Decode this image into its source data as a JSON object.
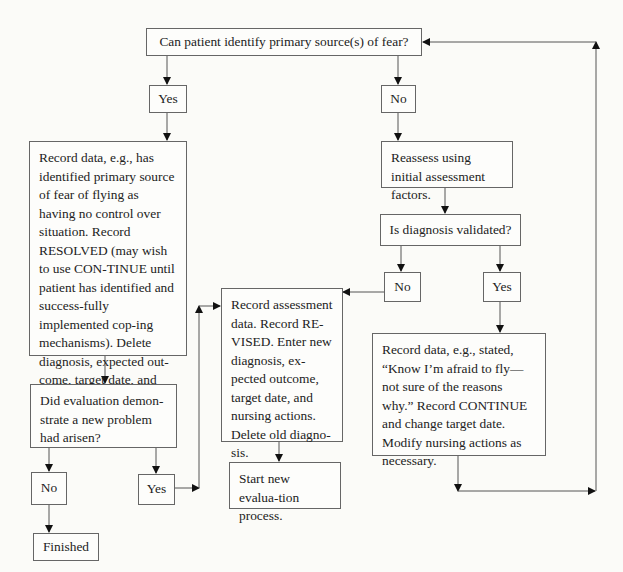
{
  "diagram": {
    "type": "flowchart",
    "nodes": {
      "q1": "Can patient identify primary source(s) of fear?",
      "q1_yes": "Yes",
      "q1_no": "No",
      "resolved": "Record data, e.g., has identified primary source of fear of flying as having no control over situation. Record RESOLVED (may wish to use CON-TINUE until patient has identified and success-fully implemented cop-ing mechanisms). Delete diagnosis, expected out-come, target date, and nursing actions.",
      "q3": "Did evaluation demon-strate a new problem had arisen?",
      "q3_no": "No",
      "q3_yes": "Yes",
      "finished": "Finished",
      "reassess": "Reassess using initial assessment factors.",
      "q2": "Is diagnosis validated?",
      "q2_no": "No",
      "q2_yes": "Yes",
      "revised": "Record assessment data. Record RE-VISED. Enter new diagnosis, ex-pected outcome, target date, and nursing actions. Delete old diagno-sis.",
      "start_new": "Start new evalua-tion process.",
      "continue": "Record data, e.g., stated, “Know I’m afraid to fly—not sure of the reasons why.” Record CONTINUE and change target date. Modify nursing actions as necessary."
    },
    "edges": [
      [
        "q1",
        "q1_yes"
      ],
      [
        "q1",
        "q1_no"
      ],
      [
        "q1_yes",
        "resolved"
      ],
      [
        "resolved",
        "q3"
      ],
      [
        "q3",
        "q3_no"
      ],
      [
        "q3",
        "q3_yes"
      ],
      [
        "q3_no",
        "finished"
      ],
      [
        "q3_yes",
        "revised"
      ],
      [
        "q1_no",
        "reassess"
      ],
      [
        "reassess",
        "q2"
      ],
      [
        "q2",
        "q2_no"
      ],
      [
        "q2",
        "q2_yes"
      ],
      [
        "q2_no",
        "revised"
      ],
      [
        "revised",
        "start_new"
      ],
      [
        "q2_yes",
        "continue"
      ],
      [
        "continue",
        "q1"
      ]
    ]
  }
}
